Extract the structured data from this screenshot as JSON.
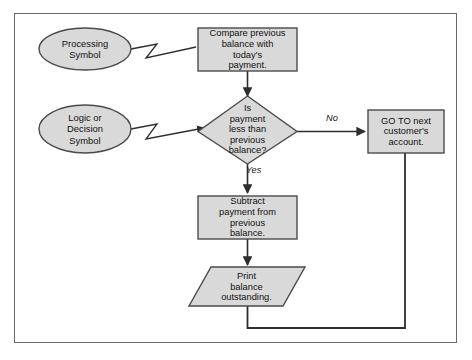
{
  "diagram": {
    "colors": {
      "shape_fill": "#d9d9d9",
      "shape_stroke": "#4a4a4a",
      "line": "#2e2e2e",
      "frame": "#6a6a6a",
      "background": "#ffffff",
      "text": "#111111"
    },
    "annotations": [
      {
        "id": "processing",
        "shape": "ellipse",
        "label": "Processing\nSymbol"
      },
      {
        "id": "logic",
        "shape": "ellipse",
        "label": "Logic or\nDecision\nSymbol"
      }
    ],
    "nodes": [
      {
        "id": "compare",
        "shape": "process",
        "label": "Compare previous\nbalance with\ntoday's\npayment."
      },
      {
        "id": "decision",
        "shape": "decision",
        "label": "Is\npayment\nless than\nprevious\nbalance?"
      },
      {
        "id": "goto",
        "shape": "process",
        "label": "GO TO next\ncustomer's\naccount."
      },
      {
        "id": "subtract",
        "shape": "process",
        "label": "Subtract\npayment from\nprevious\nbalance."
      },
      {
        "id": "print",
        "shape": "parallelogram",
        "label": "Print\nbalance\noutstanding."
      }
    ],
    "edges": [
      {
        "from": "compare",
        "to": "decision",
        "label": ""
      },
      {
        "from": "decision",
        "to": "goto",
        "label": "No"
      },
      {
        "from": "decision",
        "to": "subtract",
        "label": "Yes"
      },
      {
        "from": "subtract",
        "to": "print",
        "label": ""
      },
      {
        "from": "print",
        "to": "goto",
        "label": ""
      }
    ]
  }
}
